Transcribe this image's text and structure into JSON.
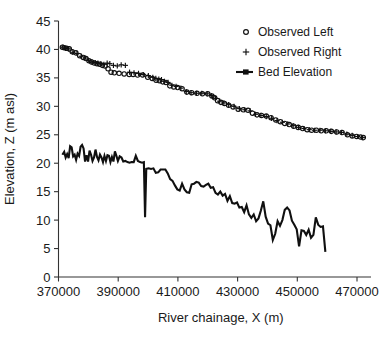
{
  "chart_data": {
    "type": "scatter",
    "title": "",
    "xlabel": "River chainage, X (m)",
    "ylabel": "Elevation, Z (m asl)",
    "xlim": [
      370000,
      472600
    ],
    "ylim": [
      0,
      45
    ],
    "xticks": [
      370000,
      390000,
      410000,
      430000,
      450000,
      470000
    ],
    "xtick_labels": [
      "370000",
      "390000",
      "410000",
      "430000",
      "450000",
      "470000"
    ],
    "yticks": [
      0,
      5,
      10,
      15,
      20,
      25,
      30,
      35,
      40,
      45
    ],
    "ytick_labels": [
      "0",
      "5",
      "10",
      "15",
      "20",
      "25",
      "30",
      "35",
      "40",
      "45"
    ],
    "grid": false,
    "legend_position": "top-right",
    "series": [
      {
        "name": "Observed Left",
        "marker": "open-circle",
        "color": "#101010",
        "points": [
          [
            371300,
            40.4
          ],
          [
            371900,
            40.3
          ],
          [
            372700,
            40.2
          ],
          [
            373600,
            40.1
          ],
          [
            374600,
            39.6
          ],
          [
            375800,
            39.4
          ],
          [
            377100,
            38.9
          ],
          [
            378300,
            38.6
          ],
          [
            379200,
            38.4
          ],
          [
            380200,
            38.0
          ],
          [
            381100,
            37.8
          ],
          [
            382000,
            37.6
          ],
          [
            382900,
            37.5
          ],
          [
            383800,
            37.4
          ],
          [
            384700,
            37.2
          ],
          [
            385600,
            37.1
          ],
          [
            386600,
            36.6
          ],
          [
            387600,
            36.0
          ],
          [
            388700,
            35.9
          ],
          [
            390300,
            35.8
          ],
          [
            392000,
            35.7
          ],
          [
            393700,
            35.6
          ],
          [
            395000,
            35.6
          ],
          [
            396500,
            35.5
          ],
          [
            398200,
            35.5
          ],
          [
            399900,
            35.1
          ],
          [
            401400,
            34.9
          ],
          [
            402700,
            34.6
          ],
          [
            403800,
            34.5
          ],
          [
            404900,
            34.3
          ],
          [
            406000,
            34.2
          ],
          [
            407300,
            33.6
          ],
          [
            408600,
            33.4
          ],
          [
            409900,
            33.3
          ],
          [
            411400,
            33.1
          ],
          [
            413000,
            32.5
          ],
          [
            414600,
            32.4
          ],
          [
            416400,
            32.3
          ],
          [
            418200,
            32.2
          ],
          [
            420000,
            32.2
          ],
          [
            421400,
            31.8
          ],
          [
            422300,
            31.5
          ],
          [
            423300,
            31.0
          ],
          [
            424400,
            30.7
          ],
          [
            425600,
            30.5
          ],
          [
            427000,
            30.2
          ],
          [
            428500,
            29.9
          ],
          [
            430200,
            29.5
          ],
          [
            431900,
            29.4
          ],
          [
            433500,
            29.3
          ],
          [
            435000,
            28.8
          ],
          [
            436500,
            28.5
          ],
          [
            438000,
            28.4
          ],
          [
            439600,
            28.3
          ],
          [
            441200,
            28.0
          ],
          [
            442800,
            27.6
          ],
          [
            444300,
            27.3
          ],
          [
            445800,
            27.0
          ],
          [
            447300,
            26.8
          ],
          [
            448800,
            26.5
          ],
          [
            450300,
            26.3
          ],
          [
            451800,
            26.1
          ],
          [
            453300,
            25.9
          ],
          [
            454800,
            25.8
          ],
          [
            456400,
            25.8
          ],
          [
            458000,
            25.7
          ],
          [
            459700,
            25.7
          ],
          [
            461400,
            25.6
          ],
          [
            463200,
            25.5
          ],
          [
            465000,
            25.4
          ],
          [
            466800,
            25.0
          ],
          [
            468400,
            24.8
          ],
          [
            469900,
            24.7
          ],
          [
            471200,
            24.6
          ],
          [
            472100,
            24.5
          ]
        ]
      },
      {
        "name": "Observed Right",
        "marker": "plus",
        "color": "#101010",
        "points": [
          [
            371500,
            40.4
          ],
          [
            372400,
            40.2
          ],
          [
            373400,
            40.1
          ],
          [
            374800,
            39.5
          ],
          [
            376200,
            39.3
          ],
          [
            377600,
            38.8
          ],
          [
            378900,
            38.5
          ],
          [
            380000,
            38.1
          ],
          [
            381200,
            37.8
          ],
          [
            382300,
            37.7
          ],
          [
            383200,
            37.6
          ],
          [
            384200,
            37.5
          ],
          [
            385200,
            37.4
          ],
          [
            386300,
            37.6
          ],
          [
            387200,
            37.5
          ],
          [
            388400,
            37.2
          ],
          [
            389700,
            37.1
          ],
          [
            391000,
            37.3
          ],
          [
            392400,
            37.2
          ],
          [
            393800,
            36.0
          ],
          [
            395300,
            35.9
          ],
          [
            396800,
            35.8
          ],
          [
            398400,
            35.6
          ],
          [
            400100,
            35.4
          ],
          [
            401600,
            35.1
          ],
          [
            402600,
            34.9
          ],
          [
            403600,
            34.8
          ],
          [
            404500,
            34.7
          ],
          [
            405500,
            34.4
          ],
          [
            406700,
            34.2
          ],
          [
            408000,
            33.7
          ],
          [
            409400,
            33.5
          ],
          [
            411000,
            33.2
          ],
          [
            412800,
            32.6
          ],
          [
            414400,
            32.4
          ],
          [
            416200,
            32.3
          ],
          [
            418000,
            32.3
          ],
          [
            419800,
            32.2
          ],
          [
            421200,
            31.9
          ],
          [
            422600,
            31.4
          ],
          [
            424000,
            30.9
          ],
          [
            425400,
            30.6
          ],
          [
            427000,
            30.3
          ],
          [
            428800,
            30.0
          ],
          [
            430600,
            29.6
          ],
          [
            432400,
            29.4
          ],
          [
            434200,
            29.2
          ],
          [
            436000,
            28.6
          ],
          [
            437800,
            28.4
          ],
          [
            439600,
            28.2
          ],
          [
            441400,
            27.9
          ],
          [
            443200,
            27.5
          ],
          [
            445000,
            27.2
          ],
          [
            446800,
            26.9
          ],
          [
            448600,
            26.6
          ],
          [
            450400,
            26.3
          ],
          [
            452200,
            26.1
          ],
          [
            454000,
            25.9
          ],
          [
            455800,
            25.8
          ],
          [
            457600,
            25.8
          ],
          [
            459400,
            25.7
          ],
          [
            461200,
            25.6
          ],
          [
            463000,
            25.5
          ],
          [
            464800,
            25.4
          ],
          [
            466600,
            25.1
          ],
          [
            468400,
            24.9
          ],
          [
            470200,
            24.7
          ],
          [
            471800,
            24.5
          ]
        ]
      },
      {
        "name": "Bed Elevation",
        "marker": "line-square",
        "color": "#101010",
        "points": [
          [
            371300,
            21.5
          ],
          [
            371900,
            22.0
          ],
          [
            372400,
            21.0
          ],
          [
            372900,
            21.6
          ],
          [
            373400,
            20.9
          ],
          [
            373900,
            23.0
          ],
          [
            374400,
            22.8
          ],
          [
            374900,
            21.2
          ],
          [
            375400,
            21.5
          ],
          [
            375900,
            20.6
          ],
          [
            376400,
            21.7
          ],
          [
            376900,
            21.3
          ],
          [
            377400,
            22.9
          ],
          [
            377900,
            23.2
          ],
          [
            378400,
            22.6
          ],
          [
            378900,
            20.3
          ],
          [
            379400,
            21.4
          ],
          [
            379900,
            20.3
          ],
          [
            380400,
            22.2
          ],
          [
            380900,
            21.5
          ],
          [
            381400,
            20.4
          ],
          [
            381900,
            21.0
          ],
          [
            382400,
            22.4
          ],
          [
            382900,
            21.1
          ],
          [
            383400,
            20.5
          ],
          [
            383900,
            21.5
          ],
          [
            384400,
            21.0
          ],
          [
            384900,
            20.2
          ],
          [
            385400,
            21.3
          ],
          [
            385900,
            20.4
          ],
          [
            386400,
            21.4
          ],
          [
            386900,
            21.3
          ],
          [
            387400,
            20.2
          ],
          [
            387900,
            21.1
          ],
          [
            388400,
            20.3
          ],
          [
            388900,
            22.1
          ],
          [
            389400,
            21.3
          ],
          [
            389900,
            20.4
          ],
          [
            390500,
            21.2
          ],
          [
            391100,
            21.0
          ],
          [
            391700,
            20.3
          ],
          [
            392400,
            20.4
          ],
          [
            393100,
            20.2
          ],
          [
            393800,
            20.1
          ],
          [
            394500,
            20.2
          ],
          [
            395200,
            20.2
          ],
          [
            395900,
            21.3
          ],
          [
            396600,
            20.4
          ],
          [
            397300,
            20.2
          ],
          [
            398000,
            20.1
          ],
          [
            398600,
            20.2
          ],
          [
            399000,
            10.5
          ],
          [
            399400,
            19.0
          ],
          [
            400200,
            19.1
          ],
          [
            401000,
            19.0
          ],
          [
            401800,
            19.1
          ],
          [
            402600,
            18.3
          ],
          [
            403400,
            18.4
          ],
          [
            404200,
            18.9
          ],
          [
            405000,
            18.9
          ],
          [
            405800,
            18.9
          ],
          [
            406600,
            18.2
          ],
          [
            407400,
            17.2
          ],
          [
            408200,
            16.9
          ],
          [
            409000,
            16.1
          ],
          [
            409800,
            15.4
          ],
          [
            410600,
            15.2
          ],
          [
            411400,
            16.4
          ],
          [
            412200,
            15.4
          ],
          [
            413000,
            14.9
          ],
          [
            413800,
            14.8
          ],
          [
            414600,
            16.3
          ],
          [
            415400,
            16.4
          ],
          [
            416200,
            16.7
          ],
          [
            417000,
            16.6
          ],
          [
            417800,
            16.0
          ],
          [
            418600,
            15.9
          ],
          [
            419400,
            16.2
          ],
          [
            420200,
            16.4
          ],
          [
            421000,
            15.7
          ],
          [
            421800,
            15.8
          ],
          [
            422600,
            14.8
          ],
          [
            423400,
            14.5
          ],
          [
            424200,
            15.0
          ],
          [
            425000,
            14.3
          ],
          [
            425800,
            14.6
          ],
          [
            426600,
            13.4
          ],
          [
            427400,
            14.2
          ],
          [
            428200,
            13.0
          ],
          [
            429000,
            12.9
          ],
          [
            429800,
            13.1
          ],
          [
            430600,
            12.2
          ],
          [
            431400,
            12.3
          ],
          [
            432200,
            11.4
          ],
          [
            433000,
            12.6
          ],
          [
            433800,
            11.0
          ],
          [
            434600,
            10.4
          ],
          [
            435400,
            11.0
          ],
          [
            436200,
            9.8
          ],
          [
            437000,
            10.3
          ],
          [
            437800,
            11.7
          ],
          [
            438600,
            13.3
          ],
          [
            439400,
            10.6
          ],
          [
            440200,
            9.4
          ],
          [
            441000,
            9.1
          ],
          [
            441800,
            6.5
          ],
          [
            442600,
            7.6
          ],
          [
            443400,
            9.8
          ],
          [
            444200,
            9.0
          ],
          [
            445000,
            10.0
          ],
          [
            445800,
            11.8
          ],
          [
            446600,
            12.2
          ],
          [
            447400,
            11.7
          ],
          [
            448200,
            9.9
          ],
          [
            449000,
            9.2
          ],
          [
            449800,
            8.4
          ],
          [
            450600,
            5.4
          ],
          [
            451400,
            8.2
          ],
          [
            452200,
            8.1
          ],
          [
            453000,
            7.4
          ],
          [
            453800,
            8.3
          ],
          [
            454600,
            6.9
          ],
          [
            455400,
            7.4
          ],
          [
            456200,
            10.5
          ],
          [
            457000,
            9.2
          ],
          [
            457800,
            8.8
          ],
          [
            458600,
            8.9
          ],
          [
            459400,
            4.4
          ]
        ]
      }
    ]
  },
  "legend": {
    "items": [
      {
        "label": "Observed Left",
        "marker": "open-circle"
      },
      {
        "label": "Observed Right",
        "marker": "plus"
      },
      {
        "label": "Bed Elevation",
        "marker": "line-square"
      }
    ]
  }
}
